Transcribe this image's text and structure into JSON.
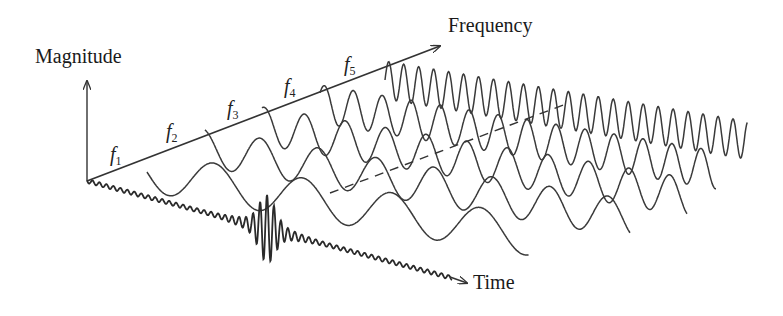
{
  "diagram": {
    "title": "",
    "axes": {
      "magnitude": {
        "label": "Magnitude"
      },
      "frequency": {
        "label": "Frequency"
      },
      "time": {
        "label": "Time"
      }
    },
    "frequency_components": [
      {
        "symbol": "f",
        "subscript": "1"
      },
      {
        "symbol": "f",
        "subscript": "2"
      },
      {
        "symbol": "f",
        "subscript": "3"
      },
      {
        "symbol": "f",
        "subscript": "4"
      },
      {
        "symbol": "f",
        "subscript": "5"
      }
    ],
    "colors": {
      "stroke": "#333333",
      "signal": "#2a2a2a",
      "background": "#ffffff"
    },
    "annotations": {
      "time_signal": "wavelet pulse along time axis",
      "dashed_line": "envelope connecting component peaks"
    }
  }
}
